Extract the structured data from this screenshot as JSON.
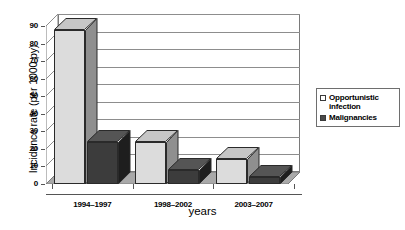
{
  "chart_data": {
    "type": "bar",
    "title": "",
    "subtitle": "",
    "xlabel": "years",
    "ylabel": "Incidence rate (per 1000 py)",
    "categories": [
      "1994–1997",
      "1998–2002",
      "2003–2007"
    ],
    "series": [
      {
        "name": "Opportunistic infection",
        "values": [
          88,
          24,
          14
        ],
        "color": "#dcdcdc"
      },
      {
        "name": "Malignancies",
        "values": [
          24,
          8,
          4
        ],
        "color": "#3c3c3c"
      }
    ],
    "ylim": [
      0,
      90
    ],
    "ytick_step": 10,
    "yticks": [
      "0",
      "10",
      "20",
      "30",
      "40",
      "50",
      "60",
      "70",
      "80",
      "90"
    ],
    "grid": true,
    "grid_axis": "y",
    "legend_position": "right",
    "style": "3d-clustered-column",
    "annotations": []
  },
  "legend": {
    "items": [
      {
        "label": "Opportunistic infection",
        "swatch": "light"
      },
      {
        "label": "Malignancies",
        "swatch": "dark"
      }
    ]
  }
}
